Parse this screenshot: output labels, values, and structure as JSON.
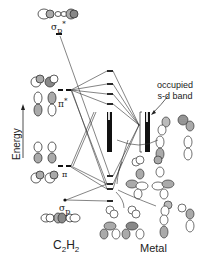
{
  "diagram": {
    "type": "molecular-orbital-interaction-diagram",
    "axis": {
      "label": "Energy",
      "direction": "up"
    },
    "left_fragment": {
      "label": "C2H2",
      "label_main": "C",
      "label_sub1": "2",
      "label_h": "H",
      "label_sub2": "2",
      "orbitals": [
        {
          "id": "sigma_p_star",
          "label": "σp*",
          "symbol": "σ",
          "subscript": "p",
          "superscript": "*"
        },
        {
          "id": "pi_star",
          "label": "π*",
          "symbol": "π",
          "superscript": "*"
        },
        {
          "id": "pi",
          "label": "π",
          "symbol": "π"
        },
        {
          "id": "sigma_p",
          "label": "σp",
          "symbol": "σ",
          "subscript": "p"
        }
      ]
    },
    "right_fragment": {
      "label": "Metal",
      "annotation": {
        "line1": "occupied",
        "line2": "s-d band"
      }
    },
    "colors": {
      "ink": "#222222",
      "lobe_fill": "#9a9a9a",
      "band_fill": "#1a1a1a",
      "background": "#ffffff"
    }
  }
}
